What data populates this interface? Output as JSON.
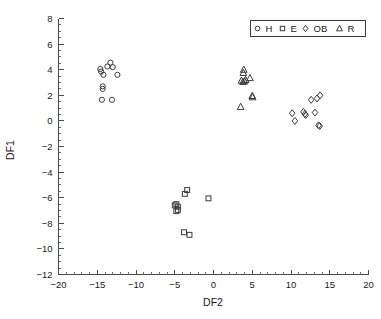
{
  "chart_data": {
    "type": "scatter",
    "title": "",
    "xlabel": "DF2",
    "ylabel": "DF1",
    "xlim": [
      -20,
      20
    ],
    "ylim": [
      -12,
      8
    ],
    "xticks": [
      -20,
      -15,
      -10,
      -5,
      0,
      5,
      10,
      15,
      20
    ],
    "yticks": [
      -12,
      -10,
      -8,
      -6,
      -4,
      -2,
      0,
      2,
      4,
      6,
      8
    ],
    "xtick_labels": [
      "−20",
      "−15",
      "−10",
      "−5",
      "0",
      "5",
      "10",
      "15",
      "20"
    ],
    "ytick_labels": [
      "−12",
      "−10",
      "−8",
      "−6",
      "−4",
      "−2",
      "0",
      "2",
      "4",
      "6",
      "8"
    ],
    "xtick_minor_step": 1,
    "ytick_minor_step": 0.5,
    "grid": false,
    "legend_position": "upper-right",
    "series": [
      {
        "name": "H",
        "marker": "circle",
        "points": [
          [
            -14.6,
            4.05
          ],
          [
            -14.5,
            3.85
          ],
          [
            -13.7,
            4.25
          ],
          [
            -13.3,
            4.55
          ],
          [
            -13.0,
            4.2
          ],
          [
            -14.2,
            3.6
          ],
          [
            -12.4,
            3.6
          ],
          [
            -14.3,
            2.7
          ],
          [
            -14.3,
            2.5
          ],
          [
            -14.4,
            1.65
          ],
          [
            -13.1,
            1.65
          ]
        ]
      },
      {
        "name": "E",
        "marker": "square",
        "points": [
          [
            -3.4,
            -5.4
          ],
          [
            -3.7,
            -5.7
          ],
          [
            -4.8,
            -6.5
          ],
          [
            -5.0,
            -6.6
          ],
          [
            -4.6,
            -6.7
          ],
          [
            -4.6,
            -6.95
          ],
          [
            -4.8,
            -7.05
          ],
          [
            -0.65,
            -6.05
          ],
          [
            -3.8,
            -8.7
          ],
          [
            -3.1,
            -8.9
          ]
        ]
      },
      {
        "name": "OB",
        "marker": "diamond",
        "points": [
          [
            13.75,
            2.0
          ],
          [
            12.6,
            1.65
          ],
          [
            13.35,
            1.75
          ],
          [
            10.15,
            0.6
          ],
          [
            11.6,
            0.7
          ],
          [
            11.8,
            0.55
          ],
          [
            11.9,
            0.45
          ],
          [
            13.1,
            0.65
          ],
          [
            10.5,
            0.0
          ],
          [
            13.55,
            -0.35
          ],
          [
            13.7,
            -0.4
          ]
        ]
      },
      {
        "name": "R",
        "marker": "triangle",
        "points": [
          [
            3.9,
            4.0
          ],
          [
            3.85,
            3.75
          ],
          [
            3.6,
            3.15
          ],
          [
            3.8,
            3.05
          ],
          [
            4.0,
            3.1
          ],
          [
            4.15,
            3.2
          ],
          [
            4.7,
            3.35
          ],
          [
            5.0,
            1.95
          ],
          [
            5.05,
            1.85
          ],
          [
            3.5,
            1.1
          ]
        ]
      }
    ]
  },
  "legend": {
    "entries": [
      {
        "marker": "circle",
        "label": "H"
      },
      {
        "marker": "square",
        "label": "E"
      },
      {
        "marker": "diamond",
        "label": "OB"
      },
      {
        "marker": "triangle",
        "label": "R"
      }
    ]
  },
  "colors": {
    "background": "#ffffff",
    "axis": "#4a4a4a",
    "marker_stroke": "#3b3b3b",
    "text": "#1a1a1a"
  }
}
